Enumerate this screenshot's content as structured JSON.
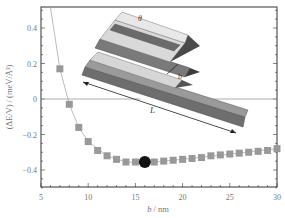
{
  "chart_data": {
    "type": "scatter",
    "title": "",
    "xlabel": "b / nm",
    "ylabel": "(ΔE/V) / (meV/Å³)",
    "xlim": [
      5,
      30
    ],
    "ylim": [
      -0.5,
      0.52
    ],
    "xticks": [
      "5",
      "10",
      "15",
      "20",
      "25",
      "30"
    ],
    "yticks": [
      "0.4",
      "0.2",
      "0",
      "−0.2",
      "−0.4"
    ],
    "grid": false,
    "legend": null,
    "series": [
      {
        "name": "ΔE/V",
        "marker": "square",
        "color": "#999999",
        "x": [
          7,
          8,
          9,
          10,
          11,
          12,
          13,
          14,
          15,
          17,
          18,
          19,
          20,
          21,
          22,
          23,
          24,
          25,
          26,
          27,
          28,
          29,
          30
        ],
        "y": [
          0.17,
          -0.03,
          -0.16,
          -0.24,
          -0.29,
          -0.32,
          -0.34,
          -0.355,
          -0.355,
          -0.355,
          -0.35,
          -0.345,
          -0.34,
          -0.335,
          -0.33,
          -0.32,
          -0.315,
          -0.31,
          -0.305,
          -0.3,
          -0.295,
          -0.29,
          -0.28
        ]
      },
      {
        "name": "fit curve",
        "line": "solid",
        "color": "#aaaaaa",
        "x": [
          6,
          7,
          8,
          9,
          10,
          12,
          14,
          16,
          20,
          25,
          30
        ],
        "y": [
          0.52,
          0.17,
          -0.03,
          -0.16,
          -0.24,
          -0.32,
          -0.355,
          -0.36,
          -0.34,
          -0.31,
          -0.28
        ]
      }
    ],
    "annotations": [
      {
        "type": "point",
        "marker": "circle",
        "color": "#111111",
        "x": 16,
        "y": -0.355,
        "label": "minimum"
      },
      {
        "type": "hline",
        "y": 0,
        "segments": [
          [
            5,
            10.5
          ],
          [
            22.5,
            30
          ]
        ]
      },
      {
        "type": "inset",
        "description": "3D schematic of stacked prism ridges",
        "labels": [
          "θ",
          "b",
          "L"
        ]
      }
    ]
  }
}
